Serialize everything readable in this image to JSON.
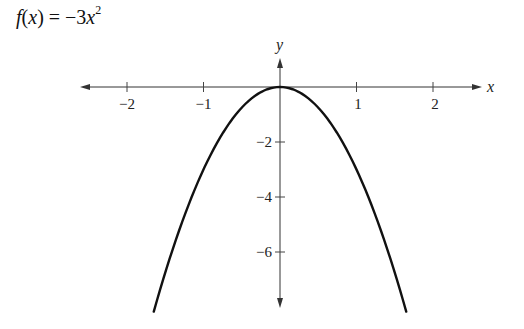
{
  "chart_data": {
    "type": "line",
    "function": "f(x) = -3x^2",
    "xlabel": "x",
    "ylabel": "y",
    "x_ticks": [
      -2,
      -1,
      1,
      2
    ],
    "x_tick_labels": [
      "−2",
      "−1",
      "1",
      "2"
    ],
    "y_ticks": [
      -2,
      -4,
      -6
    ],
    "y_tick_labels": [
      "−2",
      "−4",
      "−6"
    ],
    "xlim": [
      -2.6,
      2.6
    ],
    "ylim": [
      -8.0,
      1.0
    ],
    "grid": false,
    "legend": null,
    "series": [
      {
        "name": "f(x) = -3x^2",
        "x": [
          -1.65,
          -1.5,
          -1.25,
          -1,
          -0.75,
          -0.5,
          -0.25,
          0,
          0.25,
          0.5,
          0.75,
          1,
          1.25,
          1.5,
          1.65
        ],
        "y": [
          -8.17,
          -6.75,
          -4.69,
          -3,
          -1.69,
          -0.75,
          -0.19,
          0,
          -0.19,
          -0.75,
          -1.69,
          -3,
          -4.69,
          -6.75,
          -8.17
        ]
      }
    ],
    "vertex": {
      "x": 0,
      "y": 0
    },
    "color": "#111111"
  },
  "title": {
    "fx": "f",
    "paren_open": "(",
    "var": "x",
    "paren_close": ")",
    "equals": " = −3",
    "var2": "x",
    "exponent": "2"
  },
  "axes": {
    "x_name": "x",
    "y_name": "y",
    "x_labels": [
      "−2",
      "−1",
      "1",
      "2"
    ],
    "y_labels": [
      "−2",
      "−4",
      "−6"
    ]
  }
}
